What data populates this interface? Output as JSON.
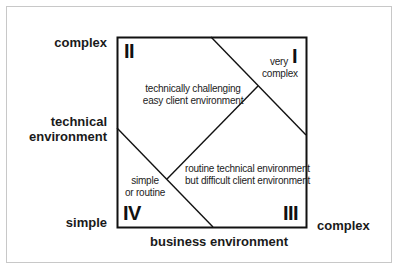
{
  "diagram": {
    "axes": {
      "y_axis": {
        "title": "technical environment",
        "title_line1": "technical",
        "title_line2": "environment",
        "top_label": "complex",
        "bottom_label": "simple"
      },
      "x_axis": {
        "title": "business environment",
        "right_label": "complex"
      }
    },
    "quadrants": [
      {
        "id": "I",
        "numeral": "I",
        "description": "very complex",
        "line1": "very",
        "line2": "complex"
      },
      {
        "id": "II",
        "numeral": "II",
        "description": "technically challenging easy client environment",
        "line1": "technically challenging",
        "line2": "easy client environment"
      },
      {
        "id": "III",
        "numeral": "III",
        "description": "routine technical environment but difficult client environment",
        "line1": "routine technical environment",
        "line2": "but difficult client environment"
      },
      {
        "id": "IV",
        "numeral": "IV",
        "description": "simple or routine",
        "line1": "simple",
        "line2": "or routine"
      }
    ],
    "colors": {
      "line": "#111111",
      "frame": "#c8c8c8",
      "background": "#ffffff"
    }
  }
}
